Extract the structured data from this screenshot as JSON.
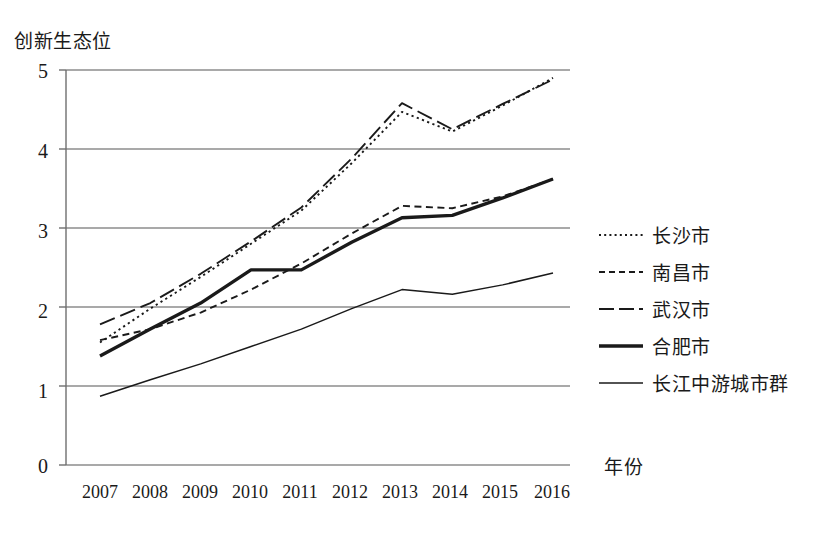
{
  "chart_data": {
    "type": "line",
    "title": "",
    "xlabel": "年份",
    "ylabel": "创新生态位",
    "categories": [
      "2007",
      "2008",
      "2009",
      "2010",
      "2011",
      "2012",
      "2013",
      "2014",
      "2015",
      "2016"
    ],
    "x": [
      2007,
      2008,
      2009,
      2010,
      2011,
      2012,
      2013,
      2014,
      2015,
      2016
    ],
    "ylim": [
      0,
      5
    ],
    "yticks": [
      0,
      1,
      2,
      3,
      4,
      5
    ],
    "grid": true,
    "legend_position": "right",
    "series": [
      {
        "name": "长沙市",
        "style": "dotted",
        "values": [
          1.55,
          1.98,
          2.38,
          2.8,
          3.22,
          3.82,
          4.47,
          4.22,
          4.55,
          4.9
        ]
      },
      {
        "name": "南昌市",
        "style": "dashed-short",
        "values": [
          1.58,
          1.72,
          1.93,
          2.22,
          2.55,
          2.93,
          3.28,
          3.25,
          3.4,
          3.62
        ]
      },
      {
        "name": "武汉市",
        "style": "dashed-long",
        "values": [
          1.78,
          2.05,
          2.42,
          2.83,
          3.26,
          3.88,
          4.58,
          4.25,
          4.57,
          4.88
        ]
      },
      {
        "name": "合肥市",
        "style": "solid-thick",
        "values": [
          1.38,
          1.72,
          2.05,
          2.47,
          2.47,
          2.82,
          3.13,
          3.16,
          3.38,
          3.62
        ]
      },
      {
        "name": "长江中游城市群",
        "style": "solid-thin",
        "values": [
          0.87,
          1.08,
          1.28,
          1.5,
          1.72,
          1.98,
          2.22,
          2.16,
          2.28,
          2.43
        ]
      }
    ]
  },
  "axis": {
    "y_label": "创新生态位",
    "x_label": "年份",
    "y_tick_labels": [
      "5",
      "4",
      "3",
      "2",
      "1",
      "0"
    ],
    "x_tick_labels": [
      "2007",
      "2008",
      "2009",
      "2010",
      "2011",
      "2012",
      "2013",
      "2014",
      "2015",
      "2016"
    ]
  },
  "legend": {
    "items": [
      {
        "label": "长沙市"
      },
      {
        "label": "南昌市"
      },
      {
        "label": "武汉市"
      },
      {
        "label": "合肥市"
      },
      {
        "label": "长江中游城市群"
      }
    ]
  },
  "colors": {
    "line": "#1a1a1a",
    "grid": "#8c8c8c",
    "axis": "#6f6f6f",
    "background": "#ffffff"
  }
}
